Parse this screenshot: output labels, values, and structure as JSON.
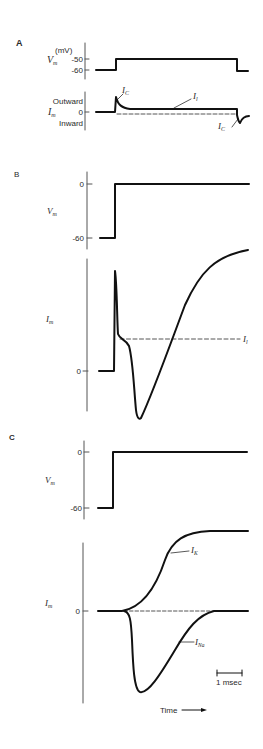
{
  "figure": {
    "panels": [
      {
        "id": "A",
        "label": "A",
        "voltage": {
          "axis_label": "V",
          "axis_sub": "m",
          "unit": "(mV)",
          "ticks": [
            "-50",
            "-60"
          ]
        },
        "current": {
          "axis_label": "I",
          "axis_sub": "m",
          "ticks": [
            "Outward",
            "0",
            "Inward"
          ],
          "annotations": [
            {
              "text": "I",
              "sub": "C"
            },
            {
              "text": "I",
              "sub": "l"
            },
            {
              "text": "I",
              "sub": "C"
            }
          ]
        }
      },
      {
        "id": "B",
        "label": "B",
        "voltage": {
          "axis_label": "V",
          "axis_sub": "m",
          "ticks": [
            "0",
            "-60"
          ]
        },
        "current": {
          "axis_label": "I",
          "axis_sub": "m",
          "ticks": [
            "0"
          ],
          "annotations": [
            {
              "text": "I",
              "sub": "l"
            }
          ]
        }
      },
      {
        "id": "C",
        "label": "C",
        "voltage": {
          "axis_label": "V",
          "axis_sub": "m",
          "ticks": [
            "0",
            "-60"
          ]
        },
        "current": {
          "axis_label": "I",
          "axis_sub": "m",
          "ticks": [
            "0"
          ],
          "annotations": [
            {
              "text": "I",
              "sub": "K"
            },
            {
              "text": "I",
              "sub": "Na"
            }
          ]
        },
        "scale_bar": "1 msec",
        "time_label": "Time"
      }
    ]
  }
}
